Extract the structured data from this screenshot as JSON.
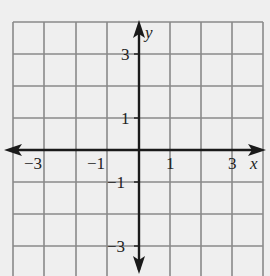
{
  "diagram": {
    "type": "coordinate-grid",
    "x_range": [
      -4,
      4
    ],
    "y_range": [
      -4,
      4
    ],
    "grid_step": 1,
    "axis_labels": {
      "x": "x",
      "y": "y"
    },
    "x_tick_labels": [
      {
        "value": -3,
        "text": "−3"
      },
      {
        "value": -1,
        "text": "−1"
      },
      {
        "value": 1,
        "text": "1"
      },
      {
        "value": 3,
        "text": "3"
      }
    ],
    "y_tick_labels": [
      {
        "value": 3,
        "text": "3"
      },
      {
        "value": 1,
        "text": "1"
      },
      {
        "value": -1,
        "text": "−1"
      },
      {
        "value": -3,
        "text": "−3"
      }
    ],
    "colors": {
      "background": "#efefef",
      "grid": "#8a8a8a",
      "axis": "#1a1a1a"
    }
  }
}
